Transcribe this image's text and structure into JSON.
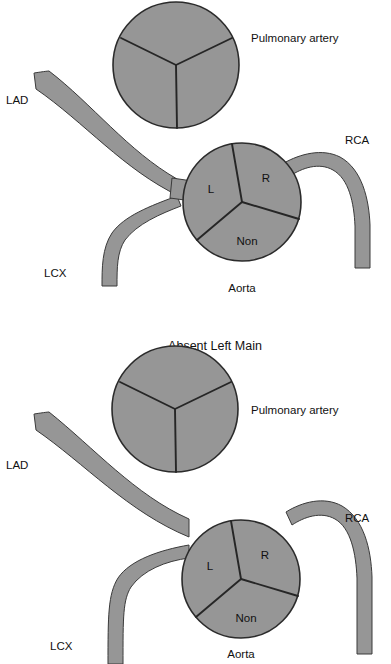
{
  "figure": {
    "type": "medical-anatomical-diagram",
    "background_color": "#ffffff",
    "vessel_fill_color": "#969696",
    "vessel_outline_color": "#2b2b2b",
    "text_color": "#111111"
  },
  "panels": [
    {
      "id": "normal-left-main",
      "title": "",
      "has_title": false,
      "description": "Normal anatomy: LAD and LCX arise from a common left main stem",
      "structures": {
        "pulmonary_artery": {
          "label": "Pulmonary artery",
          "cusp_count": 3
        },
        "aorta": {
          "label": "Aorta",
          "cusps": [
            {
              "key": "left",
              "label": "L"
            },
            {
              "key": "right",
              "label": "R"
            },
            {
              "key": "non",
              "label": "Non"
            }
          ]
        }
      },
      "vessels": [
        {
          "key": "lad",
          "label": "LAD",
          "origin": "left-main"
        },
        {
          "key": "lcx",
          "label": "LCX",
          "origin": "left-main"
        },
        {
          "key": "rca",
          "label": "RCA",
          "origin": "right-cusp"
        }
      ]
    },
    {
      "id": "absent-left-main",
      "title": "Absent Left Main",
      "has_title": true,
      "description": "Variant anatomy: LAD and LCX arise separately from the left cusp; no left main stem",
      "structures": {
        "pulmonary_artery": {
          "label": "Pulmonary artery",
          "cusp_count": 3
        },
        "aorta": {
          "label": "Aorta",
          "cusps": [
            {
              "key": "left",
              "label": "L"
            },
            {
              "key": "right",
              "label": "R"
            },
            {
              "key": "non",
              "label": "Non"
            }
          ]
        }
      },
      "vessels": [
        {
          "key": "lad",
          "label": "LAD",
          "origin": "left-cusp-separate"
        },
        {
          "key": "lcx",
          "label": "LCX",
          "origin": "left-cusp-separate"
        },
        {
          "key": "rca",
          "label": "RCA",
          "origin": "right-cusp"
        }
      ]
    }
  ]
}
